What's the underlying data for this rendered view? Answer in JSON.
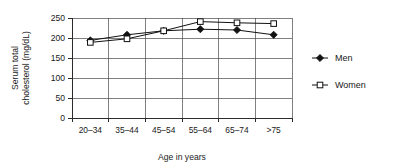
{
  "chart_data": {
    "type": "line",
    "title": "",
    "xlabel": "Age in years",
    "ylabel": "Serum total cholesterol (mg/dL)",
    "ylabel_line1": "Serum total",
    "ylabel_line2": "cholesterol (mg/dL)",
    "categories": [
      "20–34",
      "35–44",
      "45–54",
      "55–64",
      "65–74",
      ">75"
    ],
    "ylim": [
      0,
      250
    ],
    "yticks": [
      0,
      50,
      100,
      150,
      200,
      250
    ],
    "ytick_labels": [
      "0",
      "50",
      "100",
      "150",
      "200",
      "250"
    ],
    "grid": "both",
    "legend_position": "right",
    "series": [
      {
        "name": "Men",
        "marker": "filled-diamond",
        "color": "#111111",
        "values": [
          194,
          208,
          218,
          222,
          220,
          208
        ]
      },
      {
        "name": "Women",
        "marker": "open-square",
        "color": "#111111",
        "values": [
          189,
          198,
          218,
          241,
          238,
          236
        ]
      }
    ]
  },
  "legend": {
    "items": [
      {
        "label": "Men",
        "marker": "filled-diamond-icon"
      },
      {
        "label": "Women",
        "marker": "open-square-icon"
      }
    ]
  }
}
